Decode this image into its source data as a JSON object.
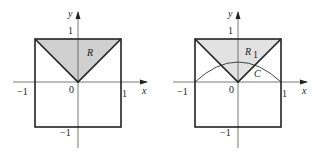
{
  "figures": [
    {
      "id": "left",
      "axis_labels": {
        "x": "x",
        "y": "y"
      },
      "ticks": {
        "x_neg": "−1",
        "x_pos": "1",
        "origin": "0",
        "y_pos": "1",
        "y_neg": "−1"
      },
      "region_label": "R",
      "region_fill": "#d4d4d4"
    },
    {
      "id": "right",
      "axis_labels": {
        "x": "x",
        "y": "y"
      },
      "ticks": {
        "x_neg": "−1",
        "x_pos": "1",
        "origin": "0",
        "y_pos": "1",
        "y_neg": "−1"
      },
      "region_label": "R",
      "region_subscript": "1",
      "curve_label": "C",
      "region_fill": "#e4e4e4"
    }
  ]
}
